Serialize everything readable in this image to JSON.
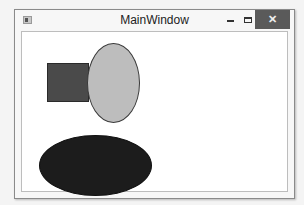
{
  "window": {
    "title": "MainWindow",
    "controls": {
      "minimize": "minimize-icon",
      "maximize": "maximize-icon",
      "close": "close-icon",
      "close_glyph": "✕"
    }
  },
  "canvas": {
    "shapes": [
      {
        "type": "rectangle",
        "fill": "#4a4a4a",
        "stroke": "#2a2a2a"
      },
      {
        "type": "ellipse",
        "fill": "#bdbdbd",
        "stroke": "#3a3a3a"
      },
      {
        "type": "ellipse",
        "fill": "#1c1c1c",
        "stroke": "#111111"
      }
    ]
  }
}
